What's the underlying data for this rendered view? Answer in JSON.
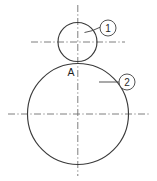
{
  "figure": {
    "background_color": "#ffffff",
    "outline_color": "#3a3a3a",
    "centerline_color": "#6f6f6f",
    "leader_color": "#4a4a4a"
  },
  "labels": {
    "tangency_point": "A"
  },
  "callouts": [
    {
      "id": "callout-1",
      "text": "1",
      "balloon_cx": 108,
      "balloon_cy": 28,
      "balloon_r": 8,
      "leader": {
        "x1": 84.5,
        "y1": 31.5,
        "x2": 100,
        "y2": 27
      }
    },
    {
      "id": "callout-2",
      "text": "2",
      "balloon_cx": 127,
      "balloon_cy": 82,
      "balloon_r": 8,
      "leader": {
        "x1": 99,
        "y1": 82,
        "x2": 119,
        "y2": 82
      }
    }
  ],
  "geometry": {
    "small_circle": {
      "cx": 77.5,
      "cy": 42,
      "r": 19.5
    },
    "large_circle": {
      "cx": 78,
      "cy": 114,
      "r": 50.5
    },
    "vertical_centerline": {
      "x": 77.8,
      "y1": 5,
      "y2": 176
    },
    "small_circle_centerline": {
      "y": 42,
      "x1": 31,
      "x2": 125
    },
    "large_circle_centerline": {
      "y": 114,
      "x1": 8,
      "x2": 149
    },
    "tangency_point": {
      "x": 77.8,
      "y": 63.5
    }
  }
}
